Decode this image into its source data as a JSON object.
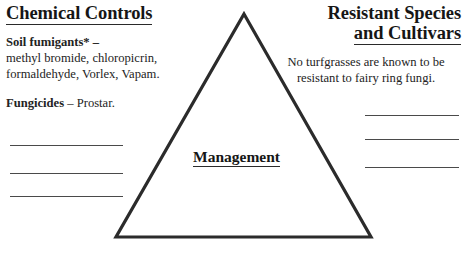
{
  "slide": {
    "background_color": "#ffffff",
    "ink_color": "#1d1d1d",
    "triangle_stroke_color": "#2b2b2b"
  },
  "left_column": {
    "heading": "Chemical Controls",
    "blocks": [
      {
        "lead": "Soil fumigants* –",
        "detail": "methyl bromide, chloropicrin, formaldehyde, Vorlex, Vapam."
      },
      {
        "lead": "Fungicides",
        "detail": " – Prostar."
      }
    ],
    "blank_lines": [
      "",
      "",
      ""
    ]
  },
  "right_column": {
    "heading_line1": "Resistant Species",
    "heading_line2": "and Cultivars",
    "body": "No turfgrasses are known to be resistant to fairy ring fungi.",
    "blank_lines": [
      "",
      "",
      ""
    ]
  },
  "center": {
    "label": "Management"
  }
}
